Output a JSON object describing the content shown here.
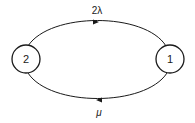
{
  "diagram": {
    "type": "state-transition",
    "nodes": [
      {
        "id": "2",
        "label": "2"
      },
      {
        "id": "1",
        "label": "1"
      }
    ],
    "edges": [
      {
        "from": "2",
        "to": "1",
        "label": "2λ",
        "position": "top"
      },
      {
        "from": "1",
        "to": "2",
        "label": "μ",
        "position": "bottom"
      }
    ],
    "colors": {
      "stroke": "#1a1a1a",
      "background": "#ffffff"
    }
  }
}
